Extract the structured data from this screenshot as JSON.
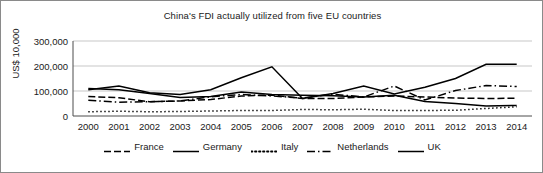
{
  "chart_data": {
    "type": "line",
    "title": "China's FDI actually utilized from five EU countries",
    "xlabel": "",
    "ylabel": "US$ 10,000",
    "grid": true,
    "legend_position": "bottom",
    "ylim": [
      0,
      300000
    ],
    "yticks": [
      "0",
      "100,000",
      "200,000",
      "300,000"
    ],
    "ytick_values": [
      0,
      100000,
      200000,
      300000
    ],
    "categories": [
      "2000",
      "2001",
      "2002",
      "2003",
      "2004",
      "2005",
      "2006",
      "2007",
      "2008",
      "2009",
      "2010",
      "2011",
      "2012",
      "2013",
      "2014"
    ],
    "series": [
      {
        "name": "France",
        "style": "dashed",
        "values": [
          78000,
          73000,
          57000,
          60000,
          66000,
          80000,
          84000,
          70000,
          70000,
          76000,
          80000,
          76000,
          72000,
          70000,
          71000
        ]
      },
      {
        "name": "Germany",
        "style": "solid",
        "values": [
          105000,
          120000,
          93000,
          86000,
          105000,
          153000,
          197000,
          70000,
          90000,
          120000,
          88000,
          115000,
          150000,
          207000,
          207000
        ]
      },
      {
        "name": "Italy",
        "style": "dotted",
        "values": [
          17000,
          19000,
          17000,
          18000,
          20000,
          22000,
          22000,
          26000,
          25000,
          27000,
          22000,
          22000,
          23000,
          30000,
          37000
        ]
      },
      {
        "name": "Netherlands",
        "style": "dash-dot",
        "values": [
          63000,
          55000,
          57000,
          60000,
          77000,
          86000,
          80000,
          72000,
          87000,
          76000,
          120000,
          64000,
          102000,
          122000,
          118000
        ]
      },
      {
        "name": "UK",
        "style": "solid",
        "values": [
          110000,
          105000,
          90000,
          74000,
          78000,
          96000,
          86000,
          83000,
          81000,
          76000,
          83000,
          58000,
          50000,
          40000,
          42000
        ]
      }
    ]
  },
  "legend": {
    "items": [
      {
        "label": "France",
        "style": "dashed"
      },
      {
        "label": "Germany",
        "style": "solid"
      },
      {
        "label": "Italy",
        "style": "dotted"
      },
      {
        "label": "Netherlands",
        "style": "dash-dot"
      },
      {
        "label": "UK",
        "style": "solid"
      }
    ]
  }
}
